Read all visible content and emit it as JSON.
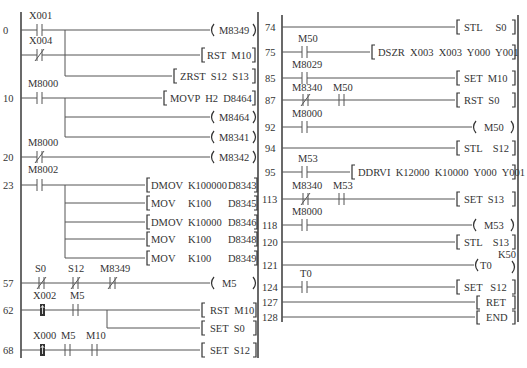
{
  "left_panel": {
    "rungs": [
      {
        "step": "0",
        "contacts": [
          {
            "name": "X001",
            "type": "NO"
          }
        ],
        "output": {
          "kind": "coil",
          "text": "M8349"
        }
      },
      {
        "step": "",
        "contacts": [
          {
            "name": "X004",
            "type": "NC"
          }
        ],
        "output": {
          "kind": "instr",
          "text": "RST  M10"
        }
      },
      {
        "step": "",
        "contacts": [],
        "output": {
          "kind": "instr",
          "text": "ZRST  S12  S13"
        }
      },
      {
        "step": "10",
        "contacts": [
          {
            "name": "M8000",
            "type": "NO"
          }
        ],
        "output": {
          "kind": "instr",
          "text": "MOVP  H2  D8464"
        }
      },
      {
        "step": "",
        "contacts": [],
        "output": {
          "kind": "coil",
          "text": "M8464"
        }
      },
      {
        "step": "",
        "contacts": [],
        "output": {
          "kind": "coil",
          "text": "M8341"
        }
      },
      {
        "step": "20",
        "contacts": [
          {
            "name": "M8000",
            "type": "NC"
          }
        ],
        "output": {
          "kind": "coil",
          "text": "M8342"
        }
      },
      {
        "step": "23",
        "contacts": [
          {
            "name": "M8002",
            "type": "NO"
          }
        ],
        "output": {
          "kind": "instr",
          "op": "DMOV",
          "a": "K100000",
          "b": "D8343"
        }
      },
      {
        "step": "",
        "contacts": [],
        "output": {
          "kind": "instr",
          "op": "MOV",
          "a": "K100",
          "b": "D8345"
        }
      },
      {
        "step": "",
        "contacts": [],
        "output": {
          "kind": "instr",
          "op": "DMOV",
          "a": "K10000",
          "b": "D8346"
        }
      },
      {
        "step": "",
        "contacts": [],
        "output": {
          "kind": "instr",
          "op": "MOV",
          "a": "K100",
          "b": "D8348"
        }
      },
      {
        "step": "",
        "contacts": [],
        "output": {
          "kind": "instr",
          "op": "MOV",
          "a": "K100",
          "b": "D8349"
        }
      },
      {
        "step": "57",
        "contacts": [
          {
            "name": "S0",
            "type": "NC"
          },
          {
            "name": "S12",
            "type": "NC"
          },
          {
            "name": "M8349",
            "type": "NC"
          }
        ],
        "output": {
          "kind": "coil",
          "text": "M5"
        }
      },
      {
        "step": "62",
        "contacts": [
          {
            "name": "X002",
            "type": "PULSE"
          },
          {
            "name": "M5",
            "type": "NO"
          }
        ],
        "output": {
          "kind": "instr",
          "text": "RST  M10"
        }
      },
      {
        "step": "",
        "contacts": [],
        "output": {
          "kind": "instr",
          "text": "SET  S0"
        }
      },
      {
        "step": "68",
        "contacts": [
          {
            "name": "X000",
            "type": "PULSE"
          },
          {
            "name": "M5",
            "type": "NO"
          },
          {
            "name": "M10",
            "type": "NO"
          }
        ],
        "output": {
          "kind": "instr",
          "text": "SET  S12"
        }
      }
    ]
  },
  "right_panel": {
    "rungs": [
      {
        "step": "74",
        "contacts": [],
        "output": {
          "kind": "instr",
          "text": "STL     S0"
        }
      },
      {
        "step": "75",
        "contacts": [
          {
            "name": "M50",
            "type": "NO"
          }
        ],
        "output": {
          "kind": "instr",
          "text": "DSZR  X003  X003  Y000  Y001"
        }
      },
      {
        "step": "85",
        "contacts": [
          {
            "name": "M8029",
            "type": "NO"
          }
        ],
        "output": {
          "kind": "instr",
          "text": "SET  M10"
        }
      },
      {
        "step": "87",
        "contacts": [
          {
            "name": "M8340",
            "type": "NC"
          },
          {
            "name": "M50",
            "type": "NO"
          }
        ],
        "output": {
          "kind": "instr",
          "text": "RST  S0"
        }
      },
      {
        "step": "92",
        "contacts": [
          {
            "name": "M8000",
            "type": "NO"
          }
        ],
        "output": {
          "kind": "coil",
          "text": "M50"
        }
      },
      {
        "step": "94",
        "contacts": [],
        "output": {
          "kind": "instr",
          "text": "STL    S12"
        }
      },
      {
        "step": "95",
        "contacts": [
          {
            "name": "M53",
            "type": "NO"
          }
        ],
        "output": {
          "kind": "instr",
          "text": "DDRVI  K12000  K10000  Y000  Y001"
        }
      },
      {
        "step": "113",
        "contacts": [
          {
            "name": "M8340",
            "type": "NC"
          },
          {
            "name": "M53",
            "type": "NO"
          }
        ],
        "output": {
          "kind": "instr",
          "text": "SET  S13"
        }
      },
      {
        "step": "118",
        "contacts": [
          {
            "name": "M8000",
            "type": "NO"
          }
        ],
        "output": {
          "kind": "coil",
          "text": "M53"
        }
      },
      {
        "step": "120",
        "contacts": [],
        "output": {
          "kind": "instr",
          "text": "STL    S13"
        }
      },
      {
        "step": "121",
        "contacts": [],
        "output": {
          "kind": "timer",
          "text": "T0",
          "preset": "K50"
        }
      },
      {
        "step": "124",
        "contacts": [
          {
            "name": "T0",
            "type": "NO"
          }
        ],
        "output": {
          "kind": "instr",
          "text": "SET   S12"
        }
      },
      {
        "step": "127",
        "contacts": [],
        "output": {
          "kind": "instr",
          "text": "RET"
        }
      },
      {
        "step": "128",
        "contacts": [],
        "output": {
          "kind": "instr",
          "text": "END"
        }
      }
    ]
  }
}
